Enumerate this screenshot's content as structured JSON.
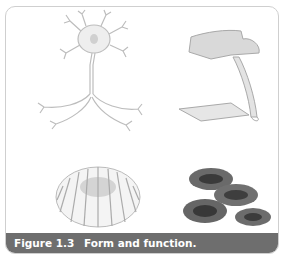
{
  "figure": {
    "number": "Figure 1.3",
    "title": "Form and function.",
    "panels": [
      {
        "name": "neuron",
        "position": "top-left"
      },
      {
        "name": "chair",
        "position": "top-right"
      },
      {
        "name": "torus-cushion",
        "position": "bottom-left"
      },
      {
        "name": "red-blood-cells",
        "position": "bottom-right"
      }
    ],
    "colors": {
      "caption_bg": "#6e6e6e",
      "caption_text": "#ffffff",
      "frame_border": "#cfcfcf"
    }
  }
}
